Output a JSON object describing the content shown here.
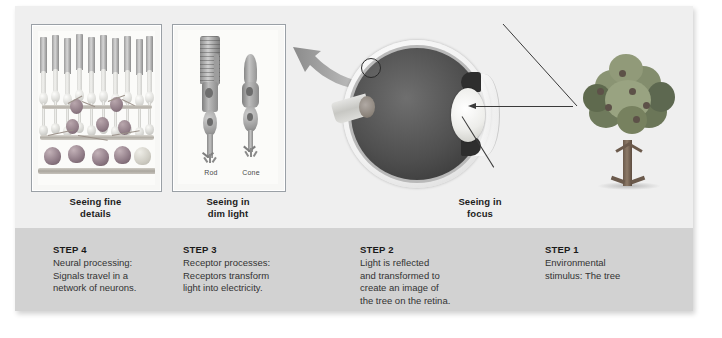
{
  "figure": {
    "background_color": "#efefef",
    "steps_band_color": "#d2d2d2"
  },
  "panels": [
    {
      "id": "retina",
      "caption": "Seeing fine\ndetails",
      "caption_line1": "Seeing fine",
      "caption_line2": "details"
    },
    {
      "id": "receptors",
      "caption_line1": "Seeing in",
      "caption_line2": "dim light",
      "labels": {
        "rod": "Rod",
        "cone": "Cone"
      }
    },
    {
      "id": "eye",
      "caption_line1": "Seeing in",
      "caption_line2": "focus"
    }
  ],
  "steps": [
    {
      "title": "STEP 4",
      "lines": [
        "Neural processing:",
        "Signals travel in a",
        "network of neurons."
      ]
    },
    {
      "title": "STEP 3",
      "lines": [
        "Receptor processes:",
        "Receptors transform",
        "light into electricity."
      ]
    },
    {
      "title": "STEP 2",
      "lines": [
        "Light is reflected",
        "and transformed to",
        "create an image of",
        "the tree on the retina."
      ]
    },
    {
      "title": "STEP 1",
      "lines": [
        "Environmental",
        "stimulus: The tree"
      ]
    }
  ],
  "icons": {
    "curved_arrow": "curved-arrow-left-icon",
    "tree_to_eye_arrow": "arrow-left-icon",
    "tree_diagonal_line": "leader-line-icon",
    "lens_leader_line": "leader-line-icon"
  },
  "colors": {
    "text_dark": "#1a1a1a",
    "text_body": "#333333",
    "band": "#d2d2d2",
    "canvas": "#efefef",
    "arrow_gray": "#8f8f8f",
    "line_dark": "#3a3a3a"
  }
}
